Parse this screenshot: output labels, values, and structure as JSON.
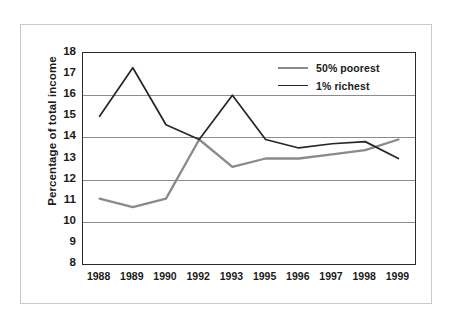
{
  "chart_data": {
    "type": "line",
    "title": "",
    "subtitle": "",
    "xlabel": "",
    "ylabel": "Percentage of total income",
    "categories": [
      "1988",
      "1989",
      "1990",
      "1992",
      "1993",
      "1995",
      "1996",
      "1997",
      "1998",
      "1999"
    ],
    "ylim": [
      8,
      18
    ],
    "ytick_labels": [
      "18",
      "17",
      "16",
      "15",
      "14",
      "13",
      "12",
      "11",
      "10",
      "9",
      "8"
    ],
    "ytick_values": [
      18,
      17,
      16,
      15,
      14,
      13,
      12,
      11,
      10,
      9,
      8
    ],
    "gridlines": [
      16,
      14,
      12,
      10
    ],
    "grid": true,
    "legend_position": "top-right",
    "series": [
      {
        "name": "50% poorest",
        "color": "#8a8a8a",
        "values": [
          11.1,
          10.7,
          11.1,
          13.9,
          12.6,
          13.0,
          13.0,
          13.2,
          13.4,
          13.9
        ]
      },
      {
        "name": "1% richest",
        "color": "#262626",
        "values": [
          15.0,
          17.3,
          14.6,
          13.9,
          16.0,
          13.9,
          13.5,
          13.7,
          13.8,
          13.0
        ]
      }
    ]
  },
  "colors": {
    "poorest_line": "#8a8a8a",
    "richest_line": "#262626",
    "gridline": "#8c8c8c",
    "axis": "#2a2a2a",
    "frame": "#c9c9c9",
    "text": "#1a1a1a",
    "background": "#ffffff"
  }
}
